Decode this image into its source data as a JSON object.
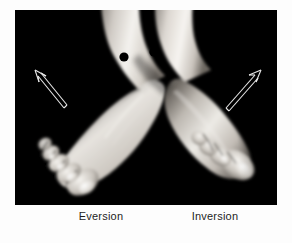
{
  "figure": {
    "background_color": "#fdfdfd",
    "plate_background_color": "#000000",
    "alt_description": "Photograph of two bare feet crossed at the ankles against a black background, the left foot everted and the right foot inverted, each with a black marker dot on the ankle and an outlined arrow showing direction of motion."
  },
  "photo": {
    "subject": "bare feet crossed at ankles",
    "backdrop_color": "#000000",
    "skin_highlight_color": "#f2f0ec",
    "skin_midtone_color": "#b9b4ae",
    "skin_shadow_color": "#4a4642",
    "markers": [
      {
        "name": "left-ankle-marker",
        "label": "ankle marker dot",
        "color": "#000000",
        "cx": 109,
        "cy": 47,
        "r": 4.6
      },
      {
        "name": "right-ankle-marker",
        "label": "ankle marker dot",
        "color": "#000000",
        "cx": 139,
        "cy": 42,
        "r": 4.6
      }
    ],
    "arrows": [
      {
        "name": "eversion-arrow",
        "label": "eversion direction arrow",
        "direction": "up-left",
        "color": "#e8e8e8",
        "style": "outlined double-line arrow",
        "tail_x": 48,
        "tail_y": 96,
        "head_x": 20,
        "head_y": 62
      },
      {
        "name": "inversion-arrow",
        "label": "inversion direction arrow",
        "direction": "up-right",
        "color": "#e8e8e8",
        "style": "outlined double-line arrow",
        "tail_x": 212,
        "tail_y": 96,
        "head_x": 243,
        "head_y": 61
      }
    ]
  },
  "captions": {
    "left": "Eversion",
    "right": "Inversion"
  }
}
